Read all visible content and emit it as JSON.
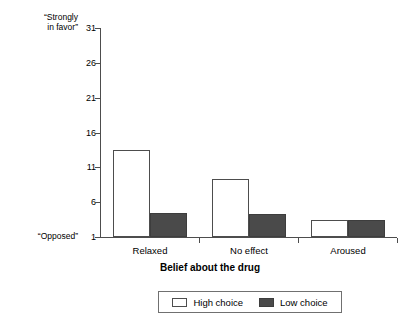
{
  "chart_data": {
    "type": "bar",
    "title": "",
    "xlabel": "Belief about the drug",
    "ylabel": "",
    "categories": [
      "Relaxed",
      "No effect",
      "Aroused"
    ],
    "series": [
      {
        "name": "High choice",
        "values": [
          13.5,
          9.3,
          3.4
        ],
        "color": "#ffffff"
      },
      {
        "name": "Low choice",
        "values": [
          4.5,
          4.3,
          3.4
        ],
        "color": "#4a4a4a"
      }
    ],
    "ylim": [
      1,
      31
    ],
    "yticks": [
      1,
      6,
      11,
      16,
      21,
      26,
      31
    ],
    "ytick_labels": [
      "1",
      "6",
      "11",
      "16",
      "21",
      "26",
      "31"
    ],
    "y_axis_anchor_high": "“Strongly\nin favor”",
    "y_axis_anchor_high_line1": "“Strongly",
    "y_axis_anchor_high_line2": "in favor”",
    "y_axis_anchor_low": "“Opposed”",
    "grid": false,
    "legend_position": "bottom-center",
    "legend": [
      "High choice",
      "Low choice"
    ]
  },
  "legend": {
    "high_label": "High choice",
    "low_label": "Low choice"
  },
  "axis": {
    "x_title": "Belief about the drug"
  }
}
